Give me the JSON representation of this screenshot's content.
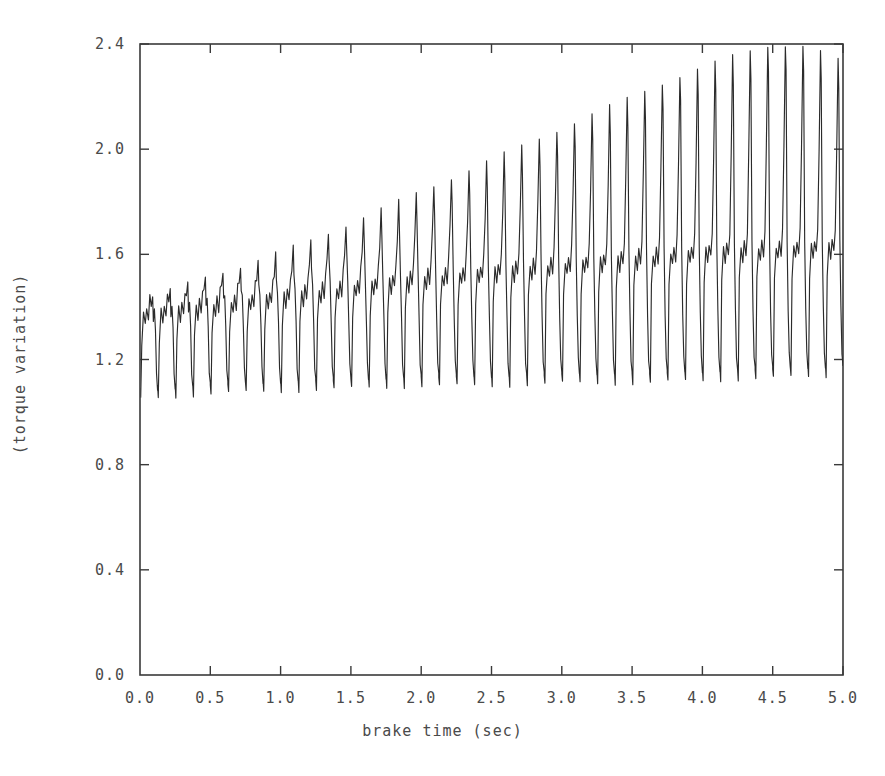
{
  "chart_data": {
    "type": "line",
    "title": "",
    "subtitle": "",
    "xlabel": "brake time (sec)",
    "ylabel": "(torque variation)",
    "xlim": [
      0.0,
      5.0
    ],
    "ylim": [
      0.0,
      2.4
    ],
    "xticks": [
      "0.0",
      "0.5",
      "1.0",
      "1.5",
      "2.0",
      "2.5",
      "3.0",
      "3.5",
      "4.0",
      "4.5",
      "5.0"
    ],
    "xtick_values": [
      0.0,
      0.5,
      1.0,
      1.5,
      2.0,
      2.5,
      3.0,
      3.5,
      4.0,
      4.5,
      5.0
    ],
    "yticks": [
      "0.0",
      "0.4",
      "0.8",
      "1.2",
      "1.6",
      "2.0",
      "2.4"
    ],
    "ytick_values": [
      0.0,
      0.4,
      0.8,
      1.2,
      1.6,
      2.0,
      2.4
    ],
    "grid": false,
    "legend": "none",
    "line_color": "#2b2b2b",
    "frame_color": "#3a3a3a",
    "background": "#ffffff",
    "tick_direction": "in",
    "series": [
      {
        "name": "torque variation",
        "description": "Growing-amplitude brake torque oscillation; sharp narrow peaks with a secondary shoulder plateau, nearly constant troughs.",
        "oscillation_frequency_hz": 8.0,
        "cycles_visible": 40,
        "peak_envelope": {
          "x": [
            0.0,
            0.25,
            0.5,
            0.75,
            1.0,
            1.25,
            1.5,
            1.75,
            2.0,
            2.25,
            2.5,
            2.75,
            3.0,
            3.25,
            3.5,
            3.75,
            4.0,
            4.25,
            4.5,
            4.75,
            5.0
          ],
          "y": [
            1.42,
            1.47,
            1.52,
            1.56,
            1.61,
            1.66,
            1.72,
            1.78,
            1.84,
            1.9,
            1.96,
            2.02,
            2.08,
            2.14,
            2.2,
            2.26,
            2.31,
            2.36,
            2.4,
            2.39,
            2.33
          ]
        },
        "trough_envelope": {
          "x": [
            0.0,
            0.5,
            1.0,
            1.5,
            2.0,
            2.5,
            3.0,
            3.5,
            4.0,
            4.5,
            5.0
          ],
          "y": [
            1.09,
            1.11,
            1.12,
            1.13,
            1.14,
            1.14,
            1.15,
            1.15,
            1.16,
            1.17,
            1.18
          ]
        },
        "shoulder_band": {
          "description": "secondary plateau level within each cycle",
          "x": [
            0.0,
            1.0,
            2.0,
            3.0,
            4.0,
            5.0
          ],
          "y": [
            1.38,
            1.45,
            1.52,
            1.57,
            1.62,
            1.64
          ]
        },
        "start_value": 1.12,
        "end_value": 1.8,
        "min_value": 1.05,
        "max_value": 2.4
      }
    ]
  },
  "figure": {
    "xlabel": "brake time (sec)",
    "ylabel": "(torque variation)"
  }
}
